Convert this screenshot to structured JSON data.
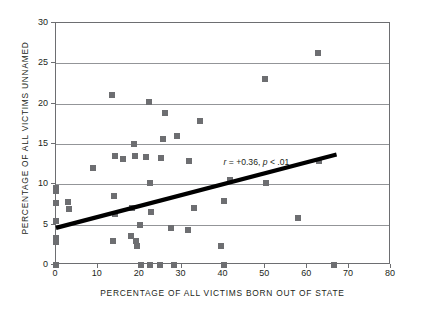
{
  "chart_data": {
    "type": "scatter",
    "title": "",
    "xlabel": "PERCENTAGE OF ALL VICTIMS BORN OUT OF STATE",
    "ylabel": "PERCENTAGE OF ALL VICTIMS UNNAMED",
    "xlim": [
      0,
      80
    ],
    "ylim": [
      0,
      30
    ],
    "xticks": [
      0,
      10,
      20,
      30,
      40,
      50,
      60,
      70,
      80
    ],
    "yticks": [
      0,
      5,
      10,
      15,
      20,
      25,
      30
    ],
    "grid": "horizontal",
    "legend": "none",
    "marker_color": "#6d6e71",
    "marker_shape": "square",
    "annotation": {
      "text": "r = +0.36, p < .01",
      "r_symbol": "r",
      "r_value": "= +0.36,",
      "p_symbol": "p",
      "p_value": "< .01",
      "x": 40.0,
      "y": 12.6
    },
    "trendline": {
      "type": "linear",
      "color": "#000000",
      "x_start": 0.0,
      "y_start": 4.6,
      "x_end": 67.0,
      "y_end": 13.7
    },
    "points": [
      {
        "x": 0.0,
        "y": 9.6
      },
      {
        "x": 0.0,
        "y": 9.2
      },
      {
        "x": 0.0,
        "y": 7.7
      },
      {
        "x": 0.0,
        "y": 5.5
      },
      {
        "x": 0.0,
        "y": 3.4
      },
      {
        "x": 0.0,
        "y": 3.0
      },
      {
        "x": 0.0,
        "y": 2.8
      },
      {
        "x": 0.0,
        "y": 0.0
      },
      {
        "x": 2.8,
        "y": 7.8
      },
      {
        "x": 3.2,
        "y": 6.9
      },
      {
        "x": 8.8,
        "y": 12.0
      },
      {
        "x": 13.3,
        "y": 21.1
      },
      {
        "x": 13.6,
        "y": 3.0
      },
      {
        "x": 13.8,
        "y": 8.5
      },
      {
        "x": 14.0,
        "y": 13.5
      },
      {
        "x": 14.2,
        "y": 6.3
      },
      {
        "x": 16.0,
        "y": 13.1
      },
      {
        "x": 18.0,
        "y": 3.6
      },
      {
        "x": 18.2,
        "y": 7.1
      },
      {
        "x": 18.6,
        "y": 15.0
      },
      {
        "x": 18.8,
        "y": 13.5
      },
      {
        "x": 19.0,
        "y": 3.0
      },
      {
        "x": 19.4,
        "y": 2.4
      },
      {
        "x": 20.0,
        "y": 5.0
      },
      {
        "x": 20.2,
        "y": 0.0
      },
      {
        "x": 21.5,
        "y": 13.4
      },
      {
        "x": 22.3,
        "y": 20.2
      },
      {
        "x": 22.4,
        "y": 10.2
      },
      {
        "x": 22.5,
        "y": 0.0
      },
      {
        "x": 22.7,
        "y": 6.6
      },
      {
        "x": 24.8,
        "y": 0.0
      },
      {
        "x": 25.0,
        "y": 13.3
      },
      {
        "x": 25.5,
        "y": 15.6
      },
      {
        "x": 26.0,
        "y": 18.8
      },
      {
        "x": 27.5,
        "y": 4.6
      },
      {
        "x": 28.2,
        "y": 0.0
      },
      {
        "x": 29.0,
        "y": 16.0
      },
      {
        "x": 31.5,
        "y": 4.4
      },
      {
        "x": 31.8,
        "y": 12.9
      },
      {
        "x": 33.0,
        "y": 7.1
      },
      {
        "x": 34.5,
        "y": 17.9
      },
      {
        "x": 39.5,
        "y": 2.3
      },
      {
        "x": 40.0,
        "y": 0.0
      },
      {
        "x": 40.0,
        "y": 7.9
      },
      {
        "x": 41.5,
        "y": 10.5
      },
      {
        "x": 50.0,
        "y": 23.0
      },
      {
        "x": 50.2,
        "y": 10.2
      },
      {
        "x": 57.8,
        "y": 5.8
      },
      {
        "x": 62.5,
        "y": 26.3
      },
      {
        "x": 62.8,
        "y": 12.9
      },
      {
        "x": 66.5,
        "y": 0.0
      }
    ]
  }
}
